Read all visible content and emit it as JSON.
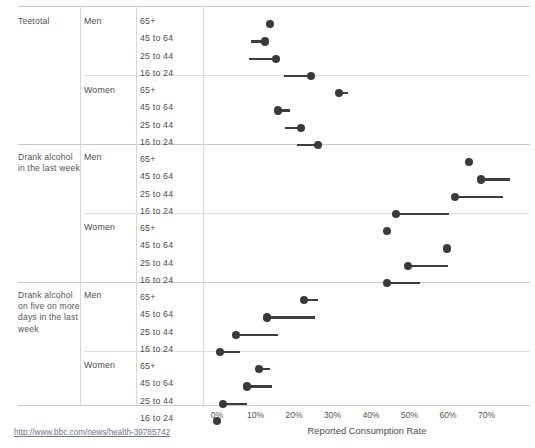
{
  "axis": {
    "x_title": "Reported Consumption Rate",
    "ticks": [
      "0%",
      "10%",
      "20%",
      "30%",
      "40%",
      "50%",
      "60%",
      "70%"
    ]
  },
  "source": {
    "url_text": "http://www.bbc.com/news/health-39785742"
  },
  "columns": {
    "measure": "",
    "gender": "",
    "age": ""
  },
  "labels": {
    "measure_teetotal": "Teetotal",
    "measure_week": "Drank alcohol in the last week",
    "measure_fivedays": "Drank alcohol on five on more days in the last week",
    "men": "Men",
    "women": "Women",
    "age_65": "65+",
    "age_45": "45 to 64",
    "age_25": "25 to 44",
    "age_16": "16 to 24"
  },
  "chart_data": {
    "type": "scatter",
    "title": "",
    "xlabel": "Reported Consumption Rate",
    "ylabel": "",
    "xlim": [
      0,
      78
    ],
    "xticks": [
      0,
      10,
      20,
      30,
      40,
      50,
      60,
      70
    ],
    "grid": false,
    "legend": false,
    "groups": [
      {
        "measure": "Teetotal",
        "genders": [
          {
            "gender": "Men",
            "rows": [
              {
                "age": "65+",
                "value": 13.8,
                "range_start": 13.8,
                "range_end": 13.8
              },
              {
                "age": "45 to 64",
                "value": 12.5,
                "range_start": 8.8,
                "range_end": 12.5
              },
              {
                "age": "25 to 44",
                "value": 15.3,
                "range_start": 8.3,
                "range_end": 15.3
              },
              {
                "age": "16 to 24",
                "value": 24.4,
                "range_start": 17.4,
                "range_end": 24.4
              }
            ]
          },
          {
            "gender": "Women",
            "rows": [
              {
                "age": "65+",
                "value": 31.7,
                "range_start": 31.7,
                "range_end": 34.0
              },
              {
                "age": "45 to 64",
                "value": 15.8,
                "range_start": 15.8,
                "range_end": 19.0
              },
              {
                "age": "25 to 44",
                "value": 21.8,
                "range_start": 17.7,
                "range_end": 21.8
              },
              {
                "age": "16 to 24",
                "value": 26.2,
                "range_start": 20.8,
                "range_end": 26.2
              }
            ]
          }
        ]
      },
      {
        "measure": "Drank alcohol in the last week",
        "genders": [
          {
            "gender": "Men",
            "rows": [
              {
                "age": "65+",
                "value": 65.4,
                "range_start": 65.4,
                "range_end": 65.4
              },
              {
                "age": "45 to 64",
                "value": 68.6,
                "range_start": 68.6,
                "range_end": 76.0
              },
              {
                "age": "25 to 44",
                "value": 61.8,
                "range_start": 61.8,
                "range_end": 74.3
              },
              {
                "age": "16 to 24",
                "value": 46.5,
                "range_start": 46.5,
                "range_end": 60.3
              }
            ]
          },
          {
            "gender": "Women",
            "rows": [
              {
                "age": "65+",
                "value": 44.2,
                "range_start": 44.2,
                "range_end": 44.2
              },
              {
                "age": "45 to 64",
                "value": 59.7,
                "range_start": 59.7,
                "range_end": 59.7
              },
              {
                "age": "25 to 44",
                "value": 49.6,
                "range_start": 49.6,
                "range_end": 60.0
              },
              {
                "age": "16 to 24",
                "value": 44.2,
                "range_start": 44.2,
                "range_end": 52.7
              }
            ]
          }
        ]
      },
      {
        "measure": "Drank alcohol on five on more days in the last week",
        "genders": [
          {
            "gender": "Men",
            "rows": [
              {
                "age": "65+",
                "value": 22.6,
                "range_start": 22.6,
                "range_end": 26.2
              },
              {
                "age": "45 to 64",
                "value": 13.0,
                "range_start": 13.0,
                "range_end": 25.5
              },
              {
                "age": "25 to 44",
                "value": 4.9,
                "range_start": 4.9,
                "range_end": 15.8
              },
              {
                "age": "16 to 24",
                "value": 0.8,
                "range_start": 0.8,
                "range_end": 6.0
              }
            ]
          },
          {
            "gender": "Women",
            "rows": [
              {
                "age": "65+",
                "value": 10.9,
                "range_start": 10.9,
                "range_end": 13.8
              },
              {
                "age": "45 to 64",
                "value": 7.8,
                "range_start": 7.8,
                "range_end": 14.3
              },
              {
                "age": "25 to 44",
                "value": 1.6,
                "range_start": 1.6,
                "range_end": 7.8
              },
              {
                "age": "16 to 24",
                "value": 0.0,
                "range_start": 0.0,
                "range_end": 0.0
              }
            ]
          }
        ]
      }
    ]
  }
}
